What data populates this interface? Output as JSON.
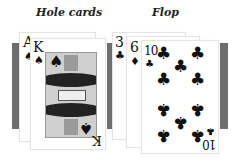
{
  "labels": {
    "hole_cards": "Hole cards",
    "flop": "Flop"
  },
  "hole_cards": [
    {
      "rank": "A",
      "suit": "♠",
      "suit_name": "spades"
    },
    {
      "rank": "K",
      "suit": "♠",
      "suit_name": "spades"
    }
  ],
  "flop": [
    {
      "rank": "3",
      "suit": "♣",
      "suit_name": "clubs"
    },
    {
      "rank": "6",
      "suit": "♦",
      "suit_name": "diamonds"
    },
    {
      "rank": "10",
      "suit": "♣",
      "suit_name": "clubs"
    }
  ],
  "colors": {
    "card_back_bar": "#6e6e6e",
    "ink": "#111111",
    "card_face": "#ffffff"
  }
}
